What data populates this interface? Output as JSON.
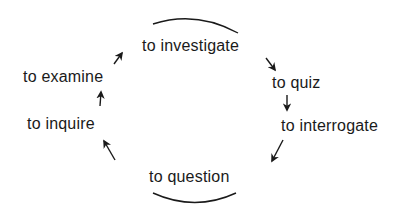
{
  "diagram": {
    "type": "cycle",
    "nodes": [
      {
        "id": "investigate",
        "label": "to investigate"
      },
      {
        "id": "quiz",
        "label": "to quiz"
      },
      {
        "id": "interrogate",
        "label": "to interrogate"
      },
      {
        "id": "question",
        "label": "to question"
      },
      {
        "id": "inquire",
        "label": "to inquire"
      },
      {
        "id": "examine",
        "label": "to examine"
      }
    ],
    "edges": [
      {
        "from": "investigate",
        "to": "quiz"
      },
      {
        "from": "quiz",
        "to": "interrogate"
      },
      {
        "from": "interrogate",
        "to": "question"
      },
      {
        "from": "question",
        "to": "inquire"
      },
      {
        "from": "inquire",
        "to": "examine"
      },
      {
        "from": "examine",
        "to": "investigate"
      }
    ],
    "colors": {
      "ink": "#1a1a1a",
      "background": "#ffffff"
    }
  }
}
